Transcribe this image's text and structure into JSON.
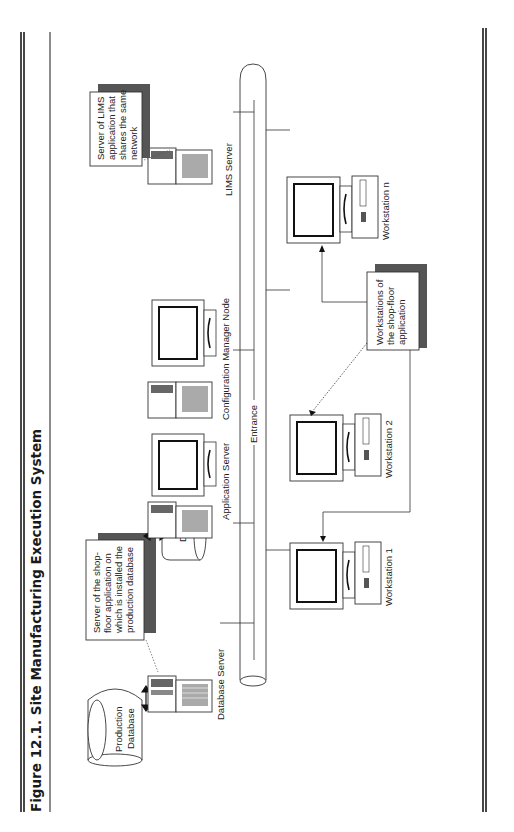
{
  "figure": {
    "title": "Figure 12.1. Site Manufacturing Execution System",
    "orientation": "rotated-90-ccw"
  },
  "network": {
    "backbone_label": "Entrance"
  },
  "nodes": {
    "database_server": {
      "label": "Database Server"
    },
    "application_server": {
      "label": "Application Server"
    },
    "config_manager": {
      "label": "Configuration Manager Node"
    },
    "lims_server": {
      "label": "LIMS Server"
    },
    "workstation_1": {
      "label": "Workstation 1"
    },
    "workstation_2": {
      "label": "Workstation 2"
    },
    "workstation_n": {
      "label": "Workstation n"
    }
  },
  "databases": {
    "production": {
      "line1": "Production",
      "line2": "Database"
    },
    "db": {
      "label": "DB"
    }
  },
  "callouts": {
    "shopfloor_server": {
      "lines": [
        "Server of the shop-",
        "floor application on",
        "which is installed the",
        "production database"
      ]
    },
    "lims": {
      "lines": [
        "Server of LIMS",
        "application that",
        "shares the same",
        "network"
      ]
    },
    "workstations": {
      "lines": [
        "Workstations of",
        "the shop-floor",
        "application"
      ]
    }
  },
  "colors": {
    "ink": "#1a1a1a",
    "shadow": "#555555",
    "paper": "#ffffff"
  }
}
